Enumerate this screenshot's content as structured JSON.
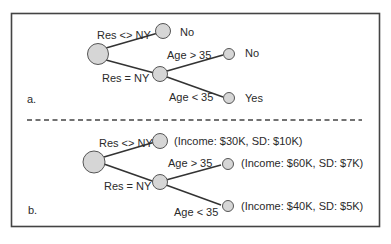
{
  "panels": {
    "a": {
      "label": "a.",
      "edges": {
        "top": "Res <> NY",
        "bottom": "Res = NY",
        "age_gt": "Age > 35",
        "age_lt": "Age < 35"
      },
      "leaves": {
        "top": "No",
        "age_gt": "No",
        "age_lt": "Yes"
      }
    },
    "b": {
      "label": "b.",
      "edges": {
        "top": "Res <> NY",
        "bottom": "Res = NY",
        "age_gt": "Age > 35",
        "age_lt": "Age < 35"
      },
      "leaves": {
        "top": "(Income: $30K, SD: $10K)",
        "age_gt": "(Income: $60K, SD: $7K)",
        "age_lt": "(Income: $40K, SD: $5K)"
      }
    }
  },
  "colors": {
    "node_fill": "#d6d6d6",
    "node_stroke": "#555555",
    "edge": "#333333",
    "frame": "#444444"
  }
}
